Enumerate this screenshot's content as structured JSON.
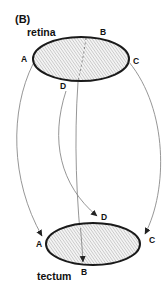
{
  "figure": {
    "panel_label": "(B)",
    "top_structure": {
      "label": "retina",
      "points": {
        "A": "A",
        "B": "B",
        "C": "C",
        "D": "D"
      }
    },
    "bottom_structure": {
      "label": "tectum",
      "points": {
        "A": "A",
        "B": "B",
        "C": "C",
        "D": "D"
      }
    },
    "projections": [
      {
        "from": "retina A",
        "to": "tectum A"
      },
      {
        "from": "retina B",
        "to": "tectum B"
      },
      {
        "from": "retina C",
        "to": "tectum C"
      },
      {
        "from": "retina D",
        "to": "tectum D"
      }
    ],
    "colors": {
      "outline": "#1a1a1a",
      "arrow": "#8a8a8a",
      "hatch": "#b0b0b0",
      "background": "#ffffff"
    }
  }
}
